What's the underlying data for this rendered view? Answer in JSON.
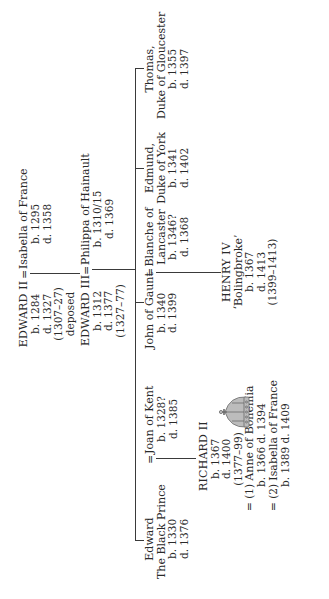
{
  "diagram": {
    "type": "family-tree",
    "title": "",
    "generation_1": {
      "king": {
        "name": "EDWARD II",
        "born": "b. 1284",
        "died": "d. 1327",
        "reign": "(1307–27)",
        "note": "deposed"
      },
      "spouse": {
        "name": "Isabella of France",
        "born": "b. 1295",
        "died": "d. 1358"
      },
      "marriage_symbol": "="
    },
    "generation_2": {
      "king": {
        "name": "EDWARD III",
        "born": "b. 1312",
        "died": "d. 1377",
        "reign": "(1327–77)"
      },
      "spouse": {
        "name": "Philippa of Hainault",
        "born": "b. 1310/15",
        "died": "d. 1369"
      },
      "marriage_symbol": "="
    },
    "generation_3": [
      {
        "name_line1": "Edward",
        "name_line2": "The Black Prince",
        "born": "b. 1330",
        "died": "d. 1376",
        "spouse": {
          "name": "Joan of Kent",
          "born": "b. 1328?",
          "died": "d. 1385"
        }
      },
      {
        "name": "John of Gaunt",
        "born": "b. 1340",
        "died": "d. 1399",
        "spouse": {
          "name_line1": "Blanche of",
          "name_line2": "Lancaster",
          "born": "b. 1346?",
          "died": "d. 1368"
        }
      },
      {
        "name_line1": "Edmund,",
        "name_line2": "Duke of York",
        "born": "b. 1341",
        "died": "d. 1402"
      },
      {
        "name_line1": "Thomas,",
        "name_line2": "Duke of Gloucester",
        "born": "b. 1355",
        "died": "d. 1397"
      }
    ],
    "generation_4": {
      "richard": {
        "name": "RICHARD II",
        "born": "b. 1367",
        "died": "d. 1400",
        "reign": "(1377–99)",
        "marriages": [
          {
            "prefix": "= (1)",
            "name": "Anne of Bohemia",
            "dates": "b. 1366 d. 1394"
          },
          {
            "prefix": "= (2)",
            "name": "Isabella of France",
            "dates": "b. 1389 d. 1409"
          }
        ]
      },
      "henry": {
        "name": "HENRY IV",
        "epithet": "‘Bolingbroke’",
        "born": "b. 1367",
        "died": "d. 1413",
        "reign": "(1399–1413)"
      }
    },
    "icons": {
      "crown": "crown-icon"
    },
    "colors": {
      "ink": "#2a2a2a",
      "background": "#ffffff"
    }
  }
}
